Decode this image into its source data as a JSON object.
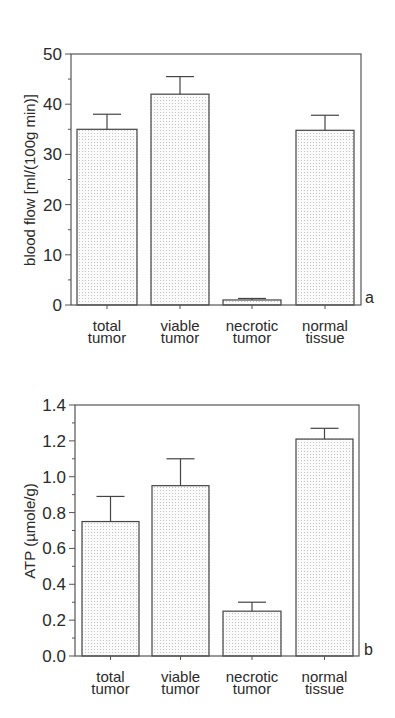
{
  "figure": {
    "panels": [
      "a",
      "b"
    ]
  },
  "colors": {
    "axis": "#555555",
    "bar_stroke": "#444444",
    "bar_fill": "#fbfbfb",
    "stipple": "#c4c4c4",
    "text": "#2a2a2a"
  },
  "chart_data": [
    {
      "type": "bar",
      "panel_label": "a",
      "title": "",
      "xlabel": "",
      "ylabel": "blood flow [ml/(100g min)]",
      "categories": [
        [
          "total",
          "tumor"
        ],
        [
          "viable",
          "tumor"
        ],
        [
          "necrotic",
          "tumor"
        ],
        [
          "normal",
          "tissue"
        ]
      ],
      "category_names": [
        "total tumor",
        "viable tumor",
        "necrotic tumor",
        "normal tissue"
      ],
      "values": [
        35.0,
        42.0,
        1.0,
        34.8
      ],
      "error_upper": [
        38.0,
        45.5,
        1.3,
        37.8
      ],
      "ylim": [
        0,
        50
      ],
      "yticks": [
        0,
        10,
        20,
        30,
        40,
        50
      ],
      "ytick_labels": [
        "0",
        "10",
        "20",
        "30",
        "40",
        "50"
      ],
      "minor_step": 5,
      "grid": false,
      "legend": null,
      "fill": "stipple"
    },
    {
      "type": "bar",
      "panel_label": "b",
      "title": "",
      "xlabel": "",
      "ylabel": "ATP (µmole/g)",
      "categories": [
        [
          "total",
          "tumor"
        ],
        [
          "viable",
          "tumor"
        ],
        [
          "necrotic",
          "tumor"
        ],
        [
          "normal",
          "tissue"
        ]
      ],
      "category_names": [
        "total tumor",
        "viable tumor",
        "necrotic tumor",
        "normal tissue"
      ],
      "values": [
        0.75,
        0.95,
        0.25,
        1.21
      ],
      "error_upper": [
        0.89,
        1.1,
        0.3,
        1.27
      ],
      "ylim": [
        0.0,
        1.4
      ],
      "yticks": [
        0.0,
        0.2,
        0.4,
        0.6,
        0.8,
        1.0,
        1.2,
        1.4
      ],
      "ytick_labels": [
        "0.0",
        "0.2",
        "0.4",
        "0.6",
        "0.8",
        "1.0",
        "1.2",
        "1.4"
      ],
      "minor_step": 0.1,
      "grid": false,
      "legend": null,
      "fill": "stipple"
    }
  ],
  "layout": [
    {
      "plot": {
        "left": 71,
        "right": 361,
        "top": 54,
        "bottom": 305
      },
      "bars": [
        [
          77,
          137
        ],
        [
          151,
          209
        ],
        [
          223,
          281
        ],
        [
          296,
          354
        ]
      ],
      "ylabel_pos": {
        "x": 30,
        "y": 180
      },
      "panel_label_pos": {
        "x": 365,
        "y": 303
      },
      "cat_label_y": [
        327,
        339
      ]
    },
    {
      "plot": {
        "left": 75,
        "right": 359,
        "top": 405,
        "bottom": 656
      },
      "bars": [
        [
          82,
          139
        ],
        [
          152,
          209
        ],
        [
          223,
          281
        ],
        [
          296,
          353
        ]
      ],
      "ylabel_pos": {
        "x": 30,
        "y": 531
      },
      "panel_label_pos": {
        "x": 364,
        "y": 655
      },
      "cat_label_y": [
        678,
        690
      ]
    }
  ]
}
